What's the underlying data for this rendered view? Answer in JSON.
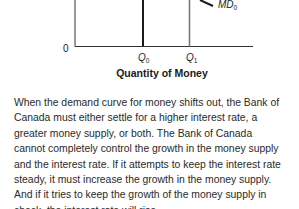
{
  "figure": {
    "origin_label": "0",
    "q0": {
      "base": "Q",
      "sub": "0"
    },
    "q1": {
      "base": "Q",
      "sub": "1"
    },
    "curve_label": {
      "base": "MD",
      "sub": "0"
    },
    "x_axis_title": "Quantity of Money"
  },
  "chart_data": {
    "type": "line",
    "title": "",
    "xlabel": "Quantity of Money",
    "ylabel": "",
    "x_ticks": [
      "0",
      "Q0",
      "Q1"
    ],
    "series": [
      {
        "name": "Money supply at Q0",
        "style": "vertical line, dark",
        "x": "Q0"
      },
      {
        "name": "Money supply at Q1",
        "style": "vertical line, gray",
        "x": "Q1"
      },
      {
        "name": "MD0",
        "style": "downward-sloping demand curve (partially visible)"
      }
    ],
    "grid": false,
    "legend": "none"
  },
  "caption": {
    "lines": [
      "When the demand curve for money shifts out, the Bank of",
      "Canada must either settle for a higher interest rate, a",
      "greater money supply, or both. The Bank of Canada",
      "cannot completely control the growth in the money supply",
      "and the interest rate. If it attempts to keep the interest rate",
      "steady, it must increase the growth in the money supply.",
      "And if it tries to keep the growth of the money supply in",
      "check, the interest rate will rise."
    ]
  },
  "colors": {
    "axis": "#333333",
    "q0_line": "#1a1a1a",
    "q1_line": "#7a7a7a",
    "md_curve": "#1a1a1a"
  }
}
